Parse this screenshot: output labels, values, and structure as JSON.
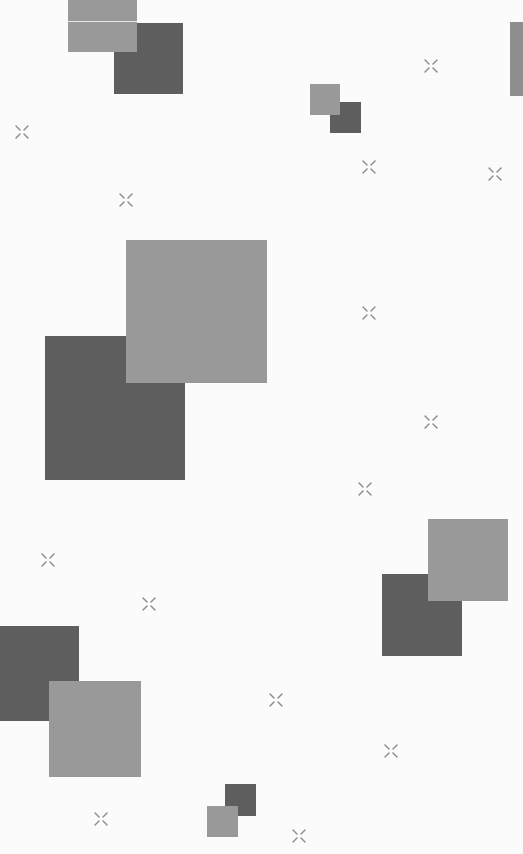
{
  "background": "#fbfbfb",
  "colors": {
    "dark_square": "#5e5e5e",
    "light_square": "#999999",
    "sparkle": "#8a8a8a",
    "edge_strip": "#8e8e8e"
  },
  "squares": [
    {
      "tone": "dark",
      "x": 114,
      "y": 23,
      "w": 69,
      "h": 71
    },
    {
      "tone": "light",
      "x": 68,
      "y": 0,
      "w": 69,
      "h": 52
    },
    {
      "tone": "dark",
      "x": 330,
      "y": 102,
      "w": 31,
      "h": 31
    },
    {
      "tone": "light",
      "x": 310,
      "y": 84,
      "w": 30,
      "h": 31
    },
    {
      "tone": "dark",
      "x": 45,
      "y": 336,
      "w": 140,
      "h": 144
    },
    {
      "tone": "light",
      "x": 126,
      "y": 240,
      "w": 141,
      "h": 143
    },
    {
      "tone": "dark",
      "x": 382,
      "y": 574,
      "w": 80,
      "h": 82
    },
    {
      "tone": "light",
      "x": 428,
      "y": 519,
      "w": 80,
      "h": 82
    },
    {
      "tone": "dark",
      "x": 0,
      "y": 626,
      "w": 79,
      "h": 95
    },
    {
      "tone": "light",
      "x": 49,
      "y": 681,
      "w": 92,
      "h": 96
    },
    {
      "tone": "dark",
      "x": 225,
      "y": 784,
      "w": 31,
      "h": 32
    },
    {
      "tone": "light",
      "x": 207,
      "y": 806,
      "w": 31,
      "h": 31
    }
  ],
  "sparkles": [
    {
      "x": 422,
      "y": 57
    },
    {
      "x": 13,
      "y": 123
    },
    {
      "x": 360,
      "y": 158
    },
    {
      "x": 486,
      "y": 165
    },
    {
      "x": 117,
      "y": 191
    },
    {
      "x": 360,
      "y": 304
    },
    {
      "x": 422,
      "y": 413
    },
    {
      "x": 356,
      "y": 480
    },
    {
      "x": 39,
      "y": 551
    },
    {
      "x": 140,
      "y": 595
    },
    {
      "x": 267,
      "y": 691
    },
    {
      "x": 382,
      "y": 742
    },
    {
      "x": 92,
      "y": 810
    },
    {
      "x": 290,
      "y": 827
    }
  ]
}
